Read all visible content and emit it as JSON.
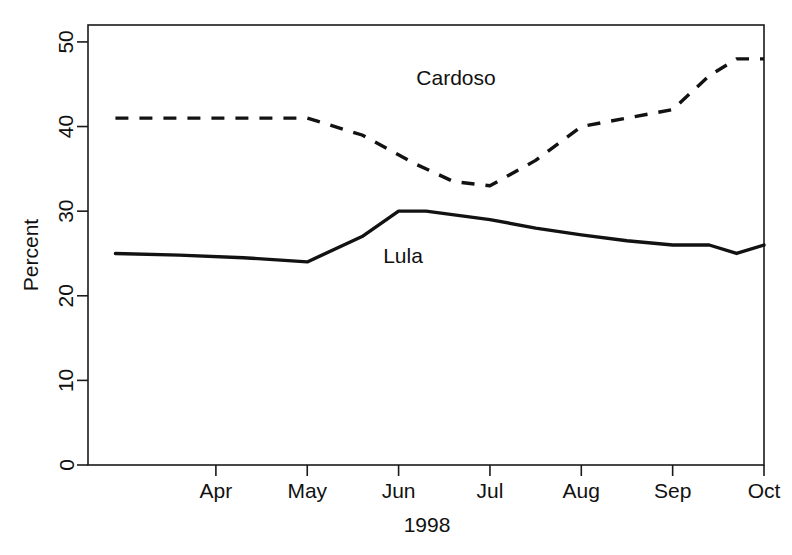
{
  "chart_data": {
    "type": "line",
    "title": "",
    "xlabel": "1998",
    "ylabel": "Percent",
    "xlim": [
      2.6,
      10.0
    ],
    "ylim": [
      0,
      52
    ],
    "yticks": [
      0,
      10,
      20,
      30,
      40,
      50
    ],
    "ytick_labels": [
      "0",
      "10",
      "20",
      "30",
      "40",
      "50"
    ],
    "xticks": [
      4,
      5,
      6,
      7,
      8,
      9,
      10
    ],
    "xtick_labels": [
      "Apr",
      "May",
      "Jun",
      "Jul",
      "Aug",
      "Sep",
      "Oct"
    ],
    "grid": false,
    "legend": "inline-annotations",
    "box_frame": true,
    "series": [
      {
        "name": "Cardoso",
        "style": "dashed",
        "annotation": "Cardoso",
        "x": [
          2.9,
          3.6,
          4.3,
          5.0,
          5.6,
          6.2,
          6.6,
          7.0,
          7.5,
          8.0,
          8.5,
          9.0,
          9.4,
          9.7,
          10.0
        ],
        "values": [
          41,
          41,
          41,
          41,
          39,
          35.5,
          33.5,
          33,
          36,
          40,
          41,
          42,
          46,
          48,
          48
        ]
      },
      {
        "name": "Lula",
        "style": "solid",
        "annotation": "Lula",
        "x": [
          2.9,
          3.6,
          4.3,
          5.0,
          5.6,
          6.0,
          6.3,
          7.0,
          7.5,
          8.0,
          8.5,
          9.0,
          9.4,
          9.7,
          10.0
        ],
        "values": [
          25,
          24.8,
          24.5,
          24,
          27,
          30,
          30,
          29,
          28,
          27.2,
          26.5,
          26,
          26,
          25,
          26
        ]
      }
    ],
    "annotations": [
      {
        "text": "Cardoso",
        "x_px": 456,
        "y_px": 85
      },
      {
        "text": "Lula",
        "x_px": 403,
        "y_px": 263
      }
    ]
  },
  "axes": {
    "y_title": "Percent",
    "x_title": "1998"
  }
}
